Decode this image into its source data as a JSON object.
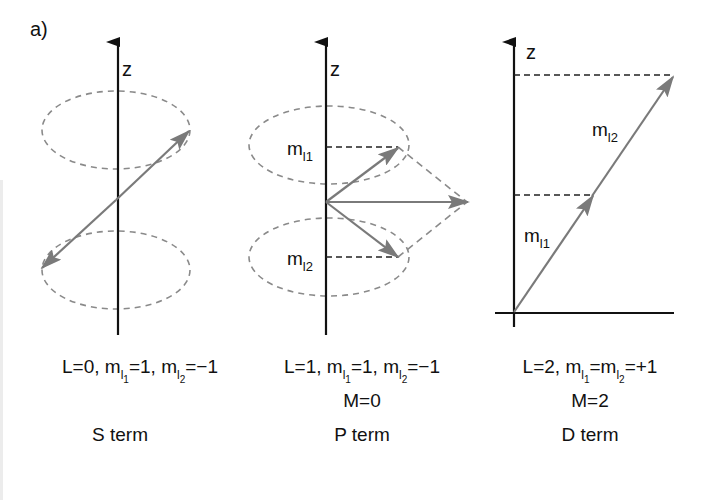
{
  "figure": {
    "panel_label": "a)",
    "colors": {
      "axis": "#111111",
      "vector": "#7a7a7a",
      "ellipse": "#8a8a8a",
      "projection_dash": "#222222",
      "background": "#ffffff"
    },
    "panels": [
      {
        "id": "s",
        "axis_label": "z",
        "caption": {
          "L": "L=0, ",
          "m1_base": "m",
          "m1_sub": "l",
          "m1_subsub": "1",
          "m1_val": "=1, ",
          "m2_base": "m",
          "m2_sub": "l",
          "m2_subsub": "2",
          "m2_val": "=−1"
        },
        "term": "S term"
      },
      {
        "id": "p",
        "axis_label": "z",
        "vector_labels": {
          "top_base": "m",
          "top_sub": "l1",
          "bottom_base": "m",
          "bottom_sub": "l2"
        },
        "caption": {
          "L": "L=1, ",
          "m1_base": "m",
          "m1_sub": "l",
          "m1_subsub": "1",
          "m1_val": "=1, ",
          "m2_base": "m",
          "m2_sub": "l",
          "m2_subsub": "2",
          "m2_val": "=−1",
          "M": "M=0"
        },
        "term": "P term"
      },
      {
        "id": "d",
        "axis_label": "z",
        "vector_labels": {
          "lower_base": "m",
          "lower_sub": "l1",
          "upper_base": "m",
          "upper_sub": "l2"
        },
        "caption": {
          "L": "L=2, ",
          "m1_base": "m",
          "m1_sub": "l",
          "m1_subsub": "1",
          "eq": "=",
          "m2_base": "m",
          "m2_sub": "l",
          "m2_subsub": "2",
          "m2_val": "=+1",
          "M": "M=2"
        },
        "term": "D term"
      }
    ]
  }
}
